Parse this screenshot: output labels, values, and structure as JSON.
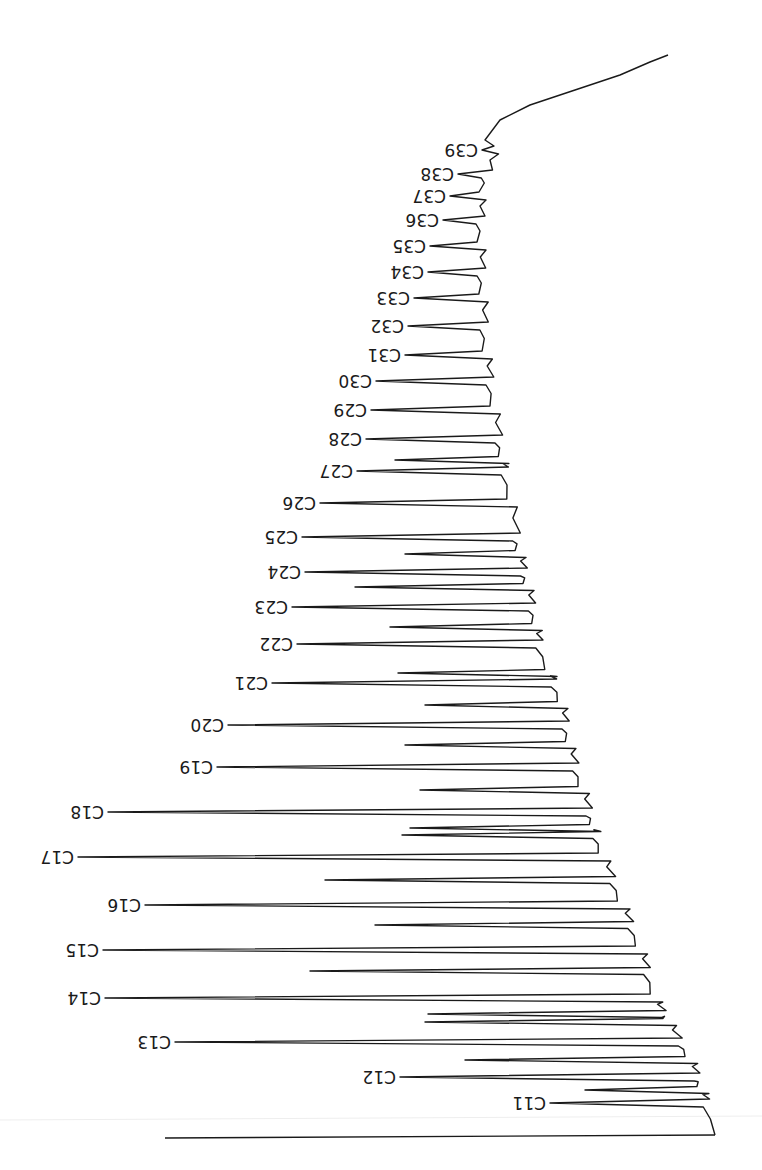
{
  "chart_data": {
    "type": "line",
    "title": "",
    "subtitle": "",
    "xlabel": "",
    "ylabel": "",
    "orientation": "rotated-180",
    "grid": false,
    "legend": null,
    "baseline": {
      "start": [
        715,
        1135
      ],
      "end": [
        668,
        55
      ]
    },
    "peaks": [
      {
        "label": "C11",
        "y": 1103,
        "tip_x": 550,
        "base_x": 700,
        "relative_height": 0.23
      },
      {
        "label": "C12",
        "y": 1077,
        "tip_x": 400,
        "base_x": 683,
        "relative_height": 0.46
      },
      {
        "label": "C13",
        "y": 1042,
        "tip_x": 175,
        "base_x": 662,
        "relative_height": 0.79
      },
      {
        "label": "C14",
        "y": 998,
        "tip_x": 105,
        "base_x": 645,
        "relative_height": 0.88
      },
      {
        "label": "C15",
        "y": 950,
        "tip_x": 103,
        "base_x": 628,
        "relative_height": 0.86
      },
      {
        "label": "C16",
        "y": 905,
        "tip_x": 145,
        "base_x": 612,
        "relative_height": 0.76
      },
      {
        "label": "C17",
        "y": 857,
        "tip_x": 78,
        "base_x": 595,
        "relative_height": 0.84
      },
      {
        "label": "C18",
        "y": 812,
        "tip_x": 108,
        "base_x": 580,
        "relative_height": 0.77
      },
      {
        "label": "C19",
        "y": 767,
        "tip_x": 217,
        "base_x": 566,
        "relative_height": 0.57
      },
      {
        "label": "C20",
        "y": 725,
        "tip_x": 228,
        "base_x": 554,
        "relative_height": 0.53
      },
      {
        "label": "C21",
        "y": 683,
        "tip_x": 272,
        "base_x": 543,
        "relative_height": 0.44
      },
      {
        "label": "C22",
        "y": 644,
        "tip_x": 297,
        "base_x": 533,
        "relative_height": 0.38
      },
      {
        "label": "C23",
        "y": 607,
        "tip_x": 292,
        "base_x": 524,
        "relative_height": 0.38
      },
      {
        "label": "C24",
        "y": 572,
        "tip_x": 305,
        "base_x": 516,
        "relative_height": 0.35
      },
      {
        "label": "C25",
        "y": 537,
        "tip_x": 302,
        "base_x": 509,
        "relative_height": 0.34
      },
      {
        "label": "C26",
        "y": 503,
        "tip_x": 320,
        "base_x": 503,
        "relative_height": 0.3
      },
      {
        "label": "C27",
        "y": 471,
        "tip_x": 357,
        "base_x": 497,
        "relative_height": 0.23
      },
      {
        "label": "C28",
        "y": 439,
        "tip_x": 366,
        "base_x": 492,
        "relative_height": 0.2
      },
      {
        "label": "C29",
        "y": 410,
        "tip_x": 371,
        "base_x": 488,
        "relative_height": 0.19
      },
      {
        "label": "C30",
        "y": 381,
        "tip_x": 376,
        "base_x": 484,
        "relative_height": 0.17
      },
      {
        "label": "C31",
        "y": 355,
        "tip_x": 405,
        "base_x": 481,
        "relative_height": 0.12
      },
      {
        "label": "C32",
        "y": 326,
        "tip_x": 408,
        "base_x": 479,
        "relative_height": 0.11
      },
      {
        "label": "C33",
        "y": 298,
        "tip_x": 414,
        "base_x": 478,
        "relative_height": 0.1
      },
      {
        "label": "C34",
        "y": 272,
        "tip_x": 428,
        "base_x": 477,
        "relative_height": 0.08
      },
      {
        "label": "C35",
        "y": 246,
        "tip_x": 430,
        "base_x": 477,
        "relative_height": 0.07
      },
      {
        "label": "C36",
        "y": 220,
        "tip_x": 443,
        "base_x": 478,
        "relative_height": 0.05
      },
      {
        "label": "C37",
        "y": 196,
        "tip_x": 450,
        "base_x": 480,
        "relative_height": 0.05
      },
      {
        "label": "C38",
        "y": 174,
        "tip_x": 458,
        "base_x": 482,
        "relative_height": 0.04
      },
      {
        "label": "C39",
        "y": 150,
        "tip_x": 482,
        "base_x": 490,
        "relative_height": 0.02
      }
    ],
    "minor_peaks": [
      {
        "y": 1090,
        "tip_x": 585
      },
      {
        "y": 1060,
        "tip_x": 465
      },
      {
        "y": 1022,
        "tip_x": 425
      },
      {
        "y": 1014,
        "tip_x": 428
      },
      {
        "y": 971,
        "tip_x": 310
      },
      {
        "y": 925,
        "tip_x": 375
      },
      {
        "y": 880,
        "tip_x": 325
      },
      {
        "y": 835,
        "tip_x": 402
      },
      {
        "y": 828,
        "tip_x": 410
      },
      {
        "y": 790,
        "tip_x": 420
      },
      {
        "y": 745,
        "tip_x": 405
      },
      {
        "y": 705,
        "tip_x": 425
      },
      {
        "y": 673,
        "tip_x": 398
      },
      {
        "y": 627,
        "tip_x": 390
      },
      {
        "y": 587,
        "tip_x": 355
      },
      {
        "y": 554,
        "tip_x": 405
      },
      {
        "y": 460,
        "tip_x": 395
      }
    ],
    "tail_line": {
      "start": [
        715,
        1135
      ],
      "end": [
        165,
        1138
      ]
    }
  }
}
